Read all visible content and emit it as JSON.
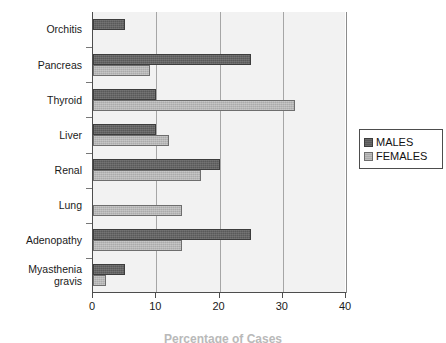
{
  "chart_data": {
    "type": "bar",
    "orientation": "horizontal",
    "title": "",
    "subtitle": "",
    "xlabel": "Percentage of Cases",
    "ylabel": "",
    "xlim": [
      0,
      40
    ],
    "xticks": [
      0,
      10,
      20,
      30,
      40
    ],
    "grid": true,
    "legend_position": "right",
    "categories": [
      "Orchitis",
      "Pancreas",
      "Thyroid",
      "Liver",
      "Renal",
      "Lung",
      "Adenopathy",
      "Myasthenia\ngravis"
    ],
    "series": [
      {
        "name": "MALES",
        "color": "#595959",
        "values": [
          5,
          25,
          10,
          10,
          20,
          0,
          25,
          5
        ]
      },
      {
        "name": "FEMALES",
        "color": "#ababab",
        "values": [
          0,
          9,
          32,
          12,
          17,
          14,
          14,
          2
        ]
      }
    ]
  },
  "axes": {
    "x_tick_labels": [
      "0",
      "10",
      "20",
      "30",
      "40"
    ]
  },
  "legend": {
    "items": [
      {
        "label": "MALES"
      },
      {
        "label": "FEMALES"
      }
    ]
  },
  "caption": {
    "text": "Percentage of Cases"
  }
}
